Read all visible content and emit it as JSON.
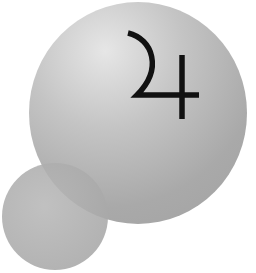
{
  "symbol": {
    "name": "Jupiter",
    "glyph": "♃",
    "color": "#111111"
  },
  "spheres": {
    "large": {
      "color": "#b0b0b0",
      "highlight": "#e6e6e6"
    },
    "small": {
      "color": "#a9a9a9"
    }
  },
  "background": "#ffffff"
}
